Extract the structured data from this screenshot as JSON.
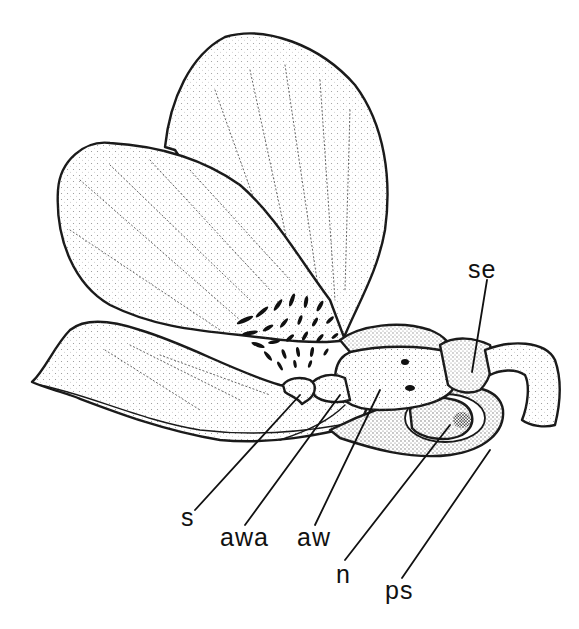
{
  "figure": {
    "ink_color": "#1a1a1a",
    "background": "#ffffff"
  },
  "labels": [
    {
      "id": "se",
      "text": "se",
      "x": 468,
      "y": 257
    },
    {
      "id": "s",
      "text": "s",
      "x": 181,
      "y": 512
    },
    {
      "id": "awa",
      "text": "awa",
      "x": 220,
      "y": 530
    },
    {
      "id": "aw",
      "text": "aw",
      "x": 297,
      "y": 530
    },
    {
      "id": "n",
      "text": "n",
      "x": 336,
      "y": 565
    },
    {
      "id": "ps",
      "text": "ps",
      "x": 385,
      "y": 582
    }
  ]
}
